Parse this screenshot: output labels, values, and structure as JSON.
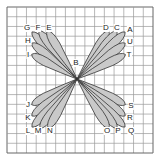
{
  "diagram": {
    "type": "stitch-chart",
    "grid": {
      "x0": 7,
      "y0": 7,
      "x1": 153,
      "y1": 153,
      "cells": 15,
      "line_color": "#9a9a9a",
      "border_color": "#666666"
    },
    "center": {
      "x": 77,
      "y": 79
    },
    "petal_fill": "#c9c9c9",
    "petal_stroke": "#333333",
    "petals": [
      {
        "id": "G",
        "tip": [
          33,
          33
        ]
      },
      {
        "id": "F",
        "tip": [
          40,
          32
        ]
      },
      {
        "id": "E",
        "tip": [
          48,
          32
        ]
      },
      {
        "id": "H",
        "tip": [
          33,
          44
        ]
      },
      {
        "id": "I",
        "tip": [
          33,
          55
        ]
      },
      {
        "id": "D",
        "tip": [
          108,
          32
        ]
      },
      {
        "id": "C",
        "tip": [
          116,
          32
        ]
      },
      {
        "id": "A",
        "tip": [
          124,
          33
        ]
      },
      {
        "id": "U",
        "tip": [
          124,
          44
        ]
      },
      {
        "id": "T",
        "tip": [
          124,
          55
        ]
      },
      {
        "id": "J",
        "tip": [
          33,
          104
        ]
      },
      {
        "id": "K",
        "tip": [
          33,
          115
        ]
      },
      {
        "id": "L",
        "tip": [
          33,
          126
        ]
      },
      {
        "id": "M",
        "tip": [
          41,
          127
        ]
      },
      {
        "id": "N",
        "tip": [
          49,
          127
        ]
      },
      {
        "id": "S",
        "tip": [
          124,
          104
        ]
      },
      {
        "id": "R",
        "tip": [
          124,
          115
        ]
      },
      {
        "id": "Q",
        "tip": [
          124,
          126
        ]
      },
      {
        "id": "P",
        "tip": [
          116,
          127
        ]
      },
      {
        "id": "O",
        "tip": [
          108,
          127
        ]
      }
    ],
    "labels": [
      {
        "text": "G",
        "x": 27,
        "y": 28
      },
      {
        "text": "F",
        "x": 38,
        "y": 28
      },
      {
        "text": "E",
        "x": 49,
        "y": 28
      },
      {
        "text": "H",
        "x": 28,
        "y": 41
      },
      {
        "text": "I",
        "x": 28,
        "y": 55
      },
      {
        "text": "D",
        "x": 106,
        "y": 28
      },
      {
        "text": "C",
        "x": 117,
        "y": 28
      },
      {
        "text": "A",
        "x": 130,
        "y": 30
      },
      {
        "text": "U",
        "x": 130,
        "y": 42
      },
      {
        "text": "T",
        "x": 129,
        "y": 55
      },
      {
        "text": "B",
        "x": 76,
        "y": 63
      },
      {
        "text": "J",
        "x": 28,
        "y": 105
      },
      {
        "text": "K",
        "x": 28,
        "y": 118
      },
      {
        "text": "L",
        "x": 28,
        "y": 131
      },
      {
        "text": "M",
        "x": 38,
        "y": 131
      },
      {
        "text": "N",
        "x": 50,
        "y": 131
      },
      {
        "text": "S",
        "x": 131,
        "y": 106
      },
      {
        "text": "R",
        "x": 130,
        "y": 118
      },
      {
        "text": "O",
        "x": 107,
        "y": 131
      },
      {
        "text": "P",
        "x": 118,
        "y": 131
      },
      {
        "text": "Q",
        "x": 131,
        "y": 131
      }
    ]
  }
}
